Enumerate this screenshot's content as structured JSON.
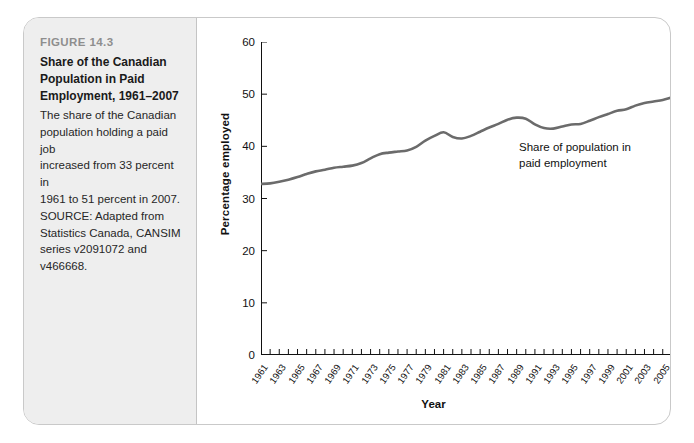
{
  "figure": {
    "number": "FIGURE 14.3",
    "title_lines": [
      "Share of the Canadian",
      "Population in Paid",
      "Employment, 1961–2007"
    ],
    "body_lines": [
      "The share of the Canadian",
      "population holding a paid job",
      "increased from 33 percent in",
      "1961 to 51 percent in 2007.",
      "SOURCE: Adapted from",
      "Statistics Canada, CANSIM",
      "series v2091072 and",
      "v466668."
    ]
  },
  "annotation": {
    "lines": [
      "Share of population in",
      "paid employment"
    ]
  },
  "colors": {
    "line": "#6b6b6b",
    "axis": "#111111",
    "panel_bg": "#eeeeee",
    "card_border": "#c9c9c9"
  },
  "chart_data": {
    "type": "line",
    "title": "Share of the Canadian Population in Paid Employment, 1961–2007",
    "xlabel": "Year",
    "ylabel": "Percentage employed",
    "ylim": [
      0,
      60
    ],
    "yticks": [
      0,
      10,
      20,
      30,
      40,
      50,
      60
    ],
    "xlim": [
      1961,
      2007
    ],
    "xtick_labels": [
      "1961",
      "1963",
      "1965",
      "1967",
      "1969",
      "1971",
      "1973",
      "1975",
      "1977",
      "1979",
      "1981",
      "1983",
      "1985",
      "1987",
      "1989",
      "1991",
      "1993",
      "1995",
      "1997",
      "1999",
      "2001",
      "2003",
      "2005",
      "2007"
    ],
    "grid": false,
    "legend": "none",
    "series": [
      {
        "name": "Share of population in paid employment",
        "x": [
          1961,
          1962,
          1963,
          1964,
          1965,
          1966,
          1967,
          1968,
          1969,
          1970,
          1971,
          1972,
          1973,
          1974,
          1975,
          1976,
          1977,
          1978,
          1979,
          1980,
          1981,
          1982,
          1983,
          1984,
          1985,
          1986,
          1987,
          1988,
          1989,
          1990,
          1991,
          1992,
          1993,
          1994,
          1995,
          1996,
          1997,
          1998,
          1999,
          2000,
          2001,
          2002,
          2003,
          2004,
          2005,
          2006,
          2007
        ],
        "values": [
          32.8,
          32.9,
          33.2,
          33.6,
          34.1,
          34.7,
          35.2,
          35.5,
          35.9,
          36.1,
          36.3,
          36.8,
          37.7,
          38.5,
          38.8,
          39.0,
          39.2,
          39.9,
          41.1,
          42.0,
          42.7,
          41.8,
          41.5,
          42.0,
          42.8,
          43.6,
          44.3,
          45.1,
          45.5,
          45.3,
          44.2,
          43.5,
          43.4,
          43.8,
          44.2,
          44.3,
          44.9,
          45.6,
          46.2,
          46.8,
          47.1,
          47.8,
          48.3,
          48.6,
          48.9,
          49.4,
          49.9
        ]
      }
    ]
  }
}
